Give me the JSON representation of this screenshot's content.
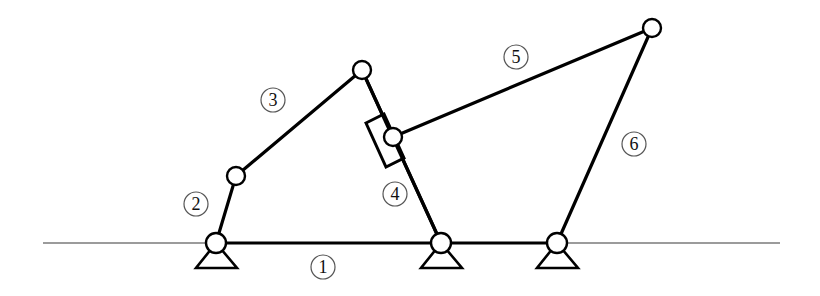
{
  "diagram": {
    "type": "planar-linkage-mechanism",
    "width": 820,
    "height": 296,
    "colors": {
      "link": "#000000",
      "ground_line": "#7a7a7a",
      "label_circle": "#555555",
      "label_text": "#111111",
      "background": "#ffffff"
    },
    "ground_line": {
      "x1": 43,
      "y1": 243,
      "x2": 780,
      "y2": 243
    },
    "joints": [
      {
        "id": "A",
        "x": 216,
        "y": 243,
        "ground_pivot": true
      },
      {
        "id": "B",
        "x": 236,
        "y": 176,
        "ground_pivot": false
      },
      {
        "id": "C",
        "x": 362,
        "y": 70,
        "ground_pivot": false
      },
      {
        "id": "D",
        "x": 393,
        "y": 137,
        "ground_pivot": false
      },
      {
        "id": "E",
        "x": 441,
        "y": 243,
        "ground_pivot": true
      },
      {
        "id": "F",
        "x": 557,
        "y": 243,
        "ground_pivot": true
      },
      {
        "id": "G",
        "x": 652,
        "y": 28,
        "ground_pivot": false
      }
    ],
    "links": [
      {
        "label": "1",
        "from": "A",
        "to": "F",
        "description": "frame / ground link"
      },
      {
        "label": "2",
        "from": "A",
        "to": "B",
        "description": "crank"
      },
      {
        "label": "3",
        "from": "B",
        "to": "C",
        "description": "coupler"
      },
      {
        "label": "4",
        "from": "C",
        "to": "E",
        "description": "rocker with slider"
      },
      {
        "label": "5",
        "from": "D",
        "to": "G",
        "description": "coupler"
      },
      {
        "label": "6",
        "from": "G",
        "to": "F",
        "description": "rocker"
      }
    ],
    "slider": {
      "on_link": "4",
      "joint": "D",
      "corners": [
        [
          366,
          123
        ],
        [
          384,
          114
        ],
        [
          404,
          158
        ],
        [
          386,
          167
        ]
      ]
    },
    "labels": [
      {
        "text": "1",
        "x": 323,
        "y": 267
      },
      {
        "text": "2",
        "x": 196,
        "y": 204
      },
      {
        "text": "3",
        "x": 273,
        "y": 100
      },
      {
        "text": "4",
        "x": 395,
        "y": 194
      },
      {
        "text": "5",
        "x": 516,
        "y": 57
      },
      {
        "text": "6",
        "x": 634,
        "y": 144
      }
    ]
  }
}
